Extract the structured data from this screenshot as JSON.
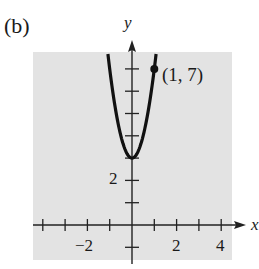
{
  "panel_label": "(b)",
  "chart_data": {
    "type": "line",
    "title": "",
    "xlabel": "x",
    "ylabel": "y",
    "xlim": [
      -4.5,
      4.5
    ],
    "ylim": [
      -1.5,
      7.5
    ],
    "grid": false,
    "background": "#e3e3e3",
    "x_ticks": [
      -4,
      -3,
      -2,
      -1,
      1,
      2,
      3,
      4
    ],
    "x_tick_labels": {
      "-2": "−2",
      "2": "2",
      "4": "4"
    },
    "y_ticks": [
      -1,
      1,
      2,
      3,
      4,
      5,
      6,
      7
    ],
    "y_tick_labels": {
      "2": "2"
    },
    "series": [
      {
        "name": "y = 4x^2 + 3",
        "function": "4x^2+3",
        "x_range": [
          -1.08,
          1.08
        ],
        "color": "#111111"
      }
    ],
    "points": [
      {
        "x": 1,
        "y": 7,
        "label": "(1, 7)"
      }
    ],
    "annotations": [
      "(1, 7)"
    ]
  },
  "labels": {
    "x_axis": "x",
    "y_axis": "y",
    "point": "(1, 7)",
    "tick_neg2": "−2",
    "tick_2": "2",
    "tick_4": "4",
    "tick_y2": "2"
  }
}
